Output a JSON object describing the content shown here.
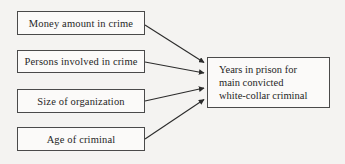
{
  "diagram": {
    "type": "flow-diagram",
    "background_color": "#f4f3f1",
    "box_border_color": "#4a4a4a",
    "box_fill_color": "#fbfaf9",
    "text_color": "#262626",
    "arrow_color": "#2b2b2b",
    "nodes": {
      "source_1": {
        "label": "Money amount in crime",
        "x": 17,
        "y": 11,
        "width": 128,
        "height": 24
      },
      "source_2": {
        "label": "Persons involved in crime",
        "x": 17,
        "y": 50,
        "width": 128,
        "height": 23
      },
      "source_3": {
        "label": "Size of organization",
        "x": 17,
        "y": 89,
        "width": 128,
        "height": 24
      },
      "source_4": {
        "label": "Age of criminal",
        "x": 17,
        "y": 127,
        "width": 128,
        "height": 24
      },
      "target_1": {
        "label": "Years in prison for\nmain convicted\nwhite-collar criminal",
        "x": 207,
        "y": 57,
        "width": 123,
        "height": 51
      }
    },
    "edges": [
      {
        "name": "money-to-years",
        "from": "source_1",
        "to": "target_1",
        "x1": 145,
        "y1": 25,
        "x2": 205,
        "y2": 63
      },
      {
        "name": "persons-to-years",
        "from": "source_2",
        "to": "target_1",
        "x1": 145,
        "y1": 62,
        "x2": 205,
        "y2": 73
      },
      {
        "name": "size-to-years",
        "from": "source_3",
        "to": "target_1",
        "x1": 145,
        "y1": 101,
        "x2": 205,
        "y2": 88
      },
      {
        "name": "age-to-years",
        "from": "source_4",
        "to": "target_1",
        "x1": 145,
        "y1": 139,
        "x2": 205,
        "y2": 99
      }
    ]
  }
}
